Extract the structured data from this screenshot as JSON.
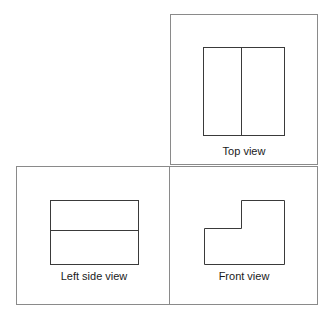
{
  "diagram": {
    "colors": {
      "frame": "#8a8a8a",
      "shape": "#3a3a3a",
      "text": "#1a1a1a"
    },
    "views": [
      {
        "id": "top",
        "label": "Top view",
        "description": "Rectangle divided by a vertical line"
      },
      {
        "id": "left_side",
        "label": "Left side view",
        "description": "Rectangle divided by a horizontal line"
      },
      {
        "id": "front",
        "label": "Front view",
        "description": "L-shaped outline, step at upper left"
      }
    ]
  }
}
